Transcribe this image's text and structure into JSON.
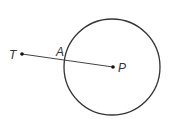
{
  "diagram": {
    "labels": {
      "T": "T",
      "A": "A",
      "P": "P"
    },
    "colors": {
      "stroke": "#333333",
      "background": "#ffffff"
    }
  }
}
